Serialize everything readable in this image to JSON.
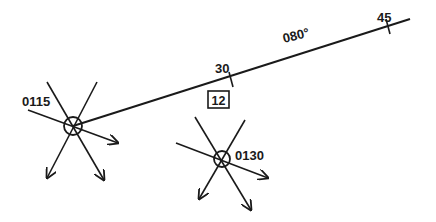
{
  "diagram": {
    "type": "dead-reckoning-track",
    "course": {
      "label": "080°",
      "start": [
        73,
        126
      ],
      "end": [
        410,
        19
      ],
      "ticks": [
        {
          "label": "30",
          "x": 231,
          "y": 80
        },
        {
          "label": "45",
          "x": 388,
          "y": 27
        }
      ],
      "speed_box": "12"
    },
    "fixes": [
      {
        "time": "0115",
        "cx": 73,
        "cy": 126,
        "r": 9
      },
      {
        "time": "0130",
        "cx": 222,
        "cy": 159,
        "r": 8
      }
    ],
    "colors": {
      "ink": "#1a1a1a",
      "background": "#ffffff"
    }
  }
}
